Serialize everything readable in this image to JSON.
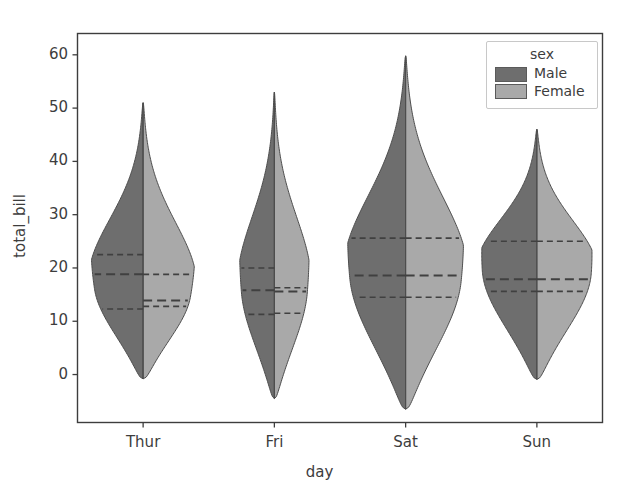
{
  "chart_data": {
    "type": "violin",
    "title": "",
    "xlabel": "day",
    "ylabel": "total_bill",
    "categories": [
      "Thur",
      "Fri",
      "Sat",
      "Sun"
    ],
    "xtick_labels": [
      "Thur",
      "Fri",
      "Sat",
      "Sun"
    ],
    "ytick_labels": [
      "0",
      "10",
      "20",
      "30",
      "40",
      "50",
      "60"
    ],
    "yticks": [
      0,
      10,
      20,
      30,
      40,
      50,
      60
    ],
    "ylim": [
      -9,
      64
    ],
    "xlim": [
      -0.5,
      3.5
    ],
    "grid": false,
    "split": true,
    "legend": {
      "title": "sex",
      "position": "upper right",
      "entries": [
        {
          "label": "Male",
          "color": "#6e6e6e"
        },
        {
          "label": "Female",
          "color": "#a9a9a9"
        }
      ]
    },
    "colors": {
      "male": "#6e6e6e",
      "female": "#a9a9a9",
      "edge": "#4d4d4d",
      "quartile_line": "#404040",
      "axis": "#3d3d3d",
      "background": "#ffffff"
    },
    "series": [
      {
        "name": "Male",
        "side": "left",
        "values": [
          {
            "category": "Thur",
            "min": -0.8,
            "max": 51.0,
            "q1": 12.3,
            "median": 18.8,
            "q3": 22.5,
            "mode": 16.0,
            "width": 0.9
          },
          {
            "category": "Fri",
            "min": -4.5,
            "max": 53.0,
            "q1": 11.3,
            "median": 15.8,
            "q3": 20.0,
            "mode": 15.5,
            "width": 0.6
          },
          {
            "category": "Sat",
            "min": -6.5,
            "max": 59.8,
            "q1": 14.5,
            "median": 18.6,
            "q3": 25.6,
            "mode": 18.0,
            "width": 1.0
          },
          {
            "category": "Sun",
            "min": -0.9,
            "max": 46.0,
            "q1": 15.6,
            "median": 17.9,
            "q3": 25.0,
            "mode": 19.5,
            "width": 0.95
          }
        ]
      },
      {
        "name": "Female",
        "side": "right",
        "values": [
          {
            "category": "Thur",
            "min": -0.8,
            "max": 51.0,
            "q1": 12.8,
            "median": 13.9,
            "q3": 18.8,
            "mode": 14.5,
            "width": 0.9
          },
          {
            "category": "Fri",
            "min": -4.5,
            "max": 53.0,
            "q1": 11.5,
            "median": 15.6,
            "q3": 16.3,
            "mode": 15.5,
            "width": 0.6
          },
          {
            "category": "Sat",
            "min": -6.5,
            "max": 59.8,
            "q1": 14.5,
            "median": 18.6,
            "q3": 25.6,
            "mode": 17.5,
            "width": 1.0
          },
          {
            "category": "Sun",
            "min": -0.9,
            "max": 46.0,
            "q1": 15.6,
            "median": 17.9,
            "q3": 25.0,
            "mode": 19.0,
            "width": 0.95
          }
        ]
      }
    ]
  }
}
